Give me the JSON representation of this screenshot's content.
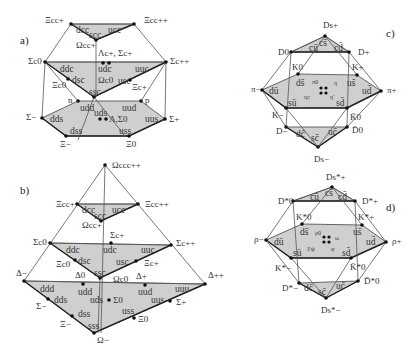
{
  "panels": {
    "a": {
      "label": "a)",
      "title": "SU(4) baryon 20-plet J=1/2",
      "top": {
        "quarks": [
          "dcc",
          "ucc",
          "scc"
        ],
        "particles": [
          "Ξcc+",
          "Ξcc++",
          "Ωcc+"
        ]
      },
      "middle": {
        "quarks": [
          "ddc",
          "udc",
          "uuc",
          "dsc",
          "usc",
          "ssc"
        ],
        "particles": [
          "Σc0",
          "Λc+, Σc+",
          "Σc++",
          "Ξc0",
          "Ξc+",
          "Ωc0"
        ]
      },
      "bottom": {
        "quarks": [
          "udd",
          "uud",
          "dds",
          "uds",
          "uus",
          "dss",
          "uss"
        ],
        "particles": [
          "n",
          "p",
          "Σ−",
          "Λ,Σ0",
          "Σ+",
          "Ξ−",
          "Ξ0"
        ]
      }
    },
    "b": {
      "label": "b)",
      "title": "SU(4) baryon 20-plet J=3/2",
      "apex": {
        "particle": "Ωccc++"
      },
      "top": {
        "quarks": [
          "dcc",
          "ucc",
          "scc"
        ],
        "particles": [
          "Ξcc+",
          "Ξcc++",
          "Ωcc+"
        ]
      },
      "middle": {
        "quarks": [
          "ddc",
          "udc",
          "uuc",
          "dsc",
          "usc",
          "ssc"
        ],
        "particles": [
          "Σc0",
          "Σc+",
          "Σc++",
          "Ξc0",
          "Ξc+",
          "Ωc0"
        ]
      },
      "bottom": {
        "quarks": [
          "ddd",
          "udd",
          "uud",
          "uuu",
          "dds",
          "uds",
          "uus",
          "dss",
          "uss",
          "sss"
        ],
        "particles": [
          "Δ−",
          "Δ0",
          "Δ+",
          "Δ++",
          "Σ−",
          "Σ0",
          "Σ+",
          "Ξ−",
          "Ξ0",
          "Ω−"
        ]
      }
    },
    "c": {
      "label": "c)",
      "title": "SU(4) pseudoscalar meson 16-plet",
      "top": {
        "quarks": [
          "cū",
          "cs̄",
          "cd̄"
        ],
        "particles": [
          "D0",
          "Ds+",
          "D+"
        ]
      },
      "middle": {
        "quarks": [
          "ds̄",
          "us̄",
          "dū",
          "ud̄",
          "sū",
          "sd̄"
        ],
        "particles": [
          "K0",
          "K+",
          "π−",
          "π+",
          "K−",
          "K̄0"
        ],
        "center": [
          "π0",
          "η",
          "ηc",
          "η′"
        ]
      },
      "bottom": {
        "quarks": [
          "dc̄",
          "sc̄",
          "uc̄"
        ],
        "particles": [
          "D−",
          "Ds−",
          "D̄0"
        ]
      }
    },
    "d": {
      "label": "d)",
      "title": "SU(4) vector meson 16-plet",
      "top": {
        "quarks": [
          "cū",
          "cs̄",
          "cd̄"
        ],
        "particles": [
          "D*0",
          "Ds*+",
          "D*+"
        ]
      },
      "middle": {
        "quarks": [
          "ds̄",
          "us̄",
          "dū",
          "ud̄",
          "sū",
          "sd̄"
        ],
        "particles": [
          "K*0",
          "K*+",
          "ρ−",
          "ρ+",
          "K*−",
          "K̄*0"
        ],
        "center": [
          "ρ0",
          "ω",
          "J/ψ",
          "φ"
        ]
      },
      "bottom": {
        "quarks": [
          "dc̄",
          "sc̄",
          "uc̄"
        ],
        "particles": [
          "D*−",
          "Ds*−",
          "D̄*0"
        ]
      }
    }
  }
}
